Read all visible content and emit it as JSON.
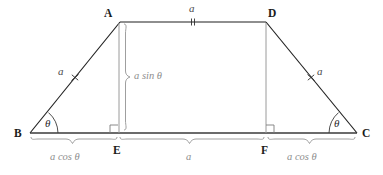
{
  "figure": {
    "background_color": "#ffffff",
    "stroke_dark": "#1f1f1f",
    "stroke_gray": "#9a9a9a",
    "label_gray": "#8e8e8e"
  },
  "vertices": {
    "A": {
      "label": "A",
      "x": 120,
      "y": 22
    },
    "B": {
      "label": "B",
      "x": 30,
      "y": 133
    },
    "C": {
      "label": "C",
      "x": 357,
      "y": 133
    },
    "D": {
      "label": "D",
      "x": 266,
      "y": 22
    },
    "E": {
      "label": "E",
      "x": 118,
      "y": 133
    },
    "F": {
      "label": "F",
      "x": 266,
      "y": 133
    }
  },
  "measures": {
    "top_side": "a",
    "left_leg": "a",
    "right_leg": "a",
    "height": "a sin θ",
    "base_left_segment": "a cos θ",
    "base_middle_segment": "a",
    "base_right_segment": "a cos θ",
    "angle_at_B": "θ",
    "angle_at_C": "θ"
  },
  "marks": {
    "single_tick_note": "single cross tick on each slanted leg",
    "double_tick_note": "double tick on top side AD",
    "right_angle_at_E": "right angle",
    "right_angle_at_F": "right angle"
  }
}
